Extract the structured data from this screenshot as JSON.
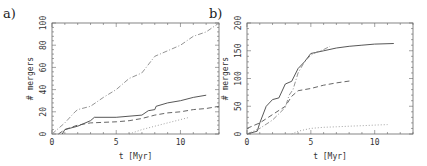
{
  "chart_data": [
    {
      "panel": "a)",
      "type": "line",
      "xlabel": "t [Myr]",
      "ylabel": "# mergers",
      "xlim": [
        0,
        13
      ],
      "ylim": [
        0,
        100
      ],
      "xticks": [
        0,
        5,
        10
      ],
      "yticks": [
        0,
        20,
        40,
        60,
        80,
        100
      ],
      "grid": false,
      "legend": null,
      "series": [
        {
          "name": "solid",
          "style": "solid",
          "x": [
            0.8,
            1,
            2,
            3,
            3.3,
            5,
            7,
            7.5,
            8,
            8.1,
            9,
            10,
            11,
            12
          ],
          "y": [
            0,
            4,
            7,
            12,
            15,
            15,
            17,
            21,
            22,
            25,
            28,
            30,
            33,
            35
          ]
        },
        {
          "name": "dashed",
          "style": "dashed",
          "x": [
            0.5,
            1,
            2,
            3,
            5,
            6,
            7,
            8,
            9,
            10,
            11,
            12,
            13
          ],
          "y": [
            0,
            4,
            8,
            10,
            11,
            12,
            14,
            17,
            19,
            20,
            22,
            23,
            25
          ]
        },
        {
          "name": "dash-dot",
          "style": "dashdot",
          "x": [
            0,
            1,
            1.8,
            2,
            3,
            4,
            5,
            6,
            7,
            8,
            9,
            10,
            11,
            12,
            13
          ],
          "y": [
            0,
            10,
            20,
            22,
            25,
            33,
            40,
            50,
            55,
            70,
            75,
            80,
            88,
            92,
            100
          ]
        },
        {
          "name": "dotted",
          "style": "dotted",
          "x": [
            6,
            7,
            8,
            9,
            10,
            10.7
          ],
          "y": [
            0,
            4,
            7,
            10,
            13,
            15
          ]
        }
      ]
    },
    {
      "panel": "b)",
      "type": "line",
      "xlabel": "t [Myr]",
      "ylabel": "# mergers",
      "xlim": [
        0,
        13
      ],
      "ylim": [
        0,
        200
      ],
      "xticks": [
        0,
        5,
        10
      ],
      "yticks": [
        0,
        50,
        100,
        150,
        200
      ],
      "grid": false,
      "legend": null,
      "series": [
        {
          "name": "solid",
          "style": "solid",
          "x": [
            0,
            0.8,
            1,
            1.5,
            2,
            2.5,
            3,
            3.5,
            4,
            4.5,
            5,
            6,
            7,
            8,
            9,
            10,
            11.5
          ],
          "y": [
            0,
            5,
            20,
            50,
            62,
            65,
            90,
            95,
            118,
            130,
            145,
            150,
            155,
            158,
            160,
            162,
            163
          ]
        },
        {
          "name": "dashed",
          "style": "dashed",
          "x": [
            0,
            1,
            2,
            3,
            3.5,
            4,
            5,
            6,
            7,
            8.2
          ],
          "y": [
            10,
            20,
            35,
            50,
            68,
            78,
            82,
            88,
            92,
            96
          ]
        },
        {
          "name": "dash-dot",
          "style": "dashdot",
          "x": [
            0,
            1,
            2,
            3,
            3.3,
            3.6,
            4,
            4.5,
            5,
            5.5,
            6,
            6.5
          ],
          "y": [
            0,
            10,
            25,
            48,
            70,
            80,
            110,
            130,
            142,
            148,
            152,
            158
          ]
        },
        {
          "name": "dotted",
          "style": "dotted",
          "x": [
            3.5,
            4,
            5,
            6,
            7,
            8,
            9,
            10,
            11
          ],
          "y": [
            0,
            5,
            10,
            12,
            13,
            14,
            15,
            16,
            17
          ]
        }
      ]
    }
  ]
}
